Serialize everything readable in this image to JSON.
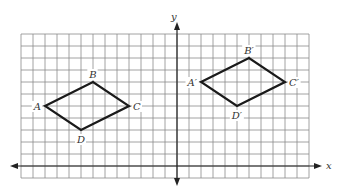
{
  "diagram": {
    "type": "coordinate-grid-translation",
    "grid": {
      "x_min": -13,
      "x_max": 11,
      "y_min": -1,
      "y_max": 11
    },
    "axes": {
      "x_label": "x",
      "y_label": "y"
    },
    "figures": [
      {
        "name": "ABCD",
        "vertices": [
          {
            "label": "A",
            "x": -11,
            "y": 5,
            "anchor": "left"
          },
          {
            "label": "B",
            "x": -7,
            "y": 7,
            "anchor": "top"
          },
          {
            "label": "C",
            "x": -4,
            "y": 5,
            "anchor": "right"
          },
          {
            "label": "D",
            "x": -8,
            "y": 3,
            "anchor": "bottom"
          }
        ]
      },
      {
        "name": "A'B'C'D'",
        "vertices": [
          {
            "label": "A′",
            "x": 2,
            "y": 7,
            "anchor": "left"
          },
          {
            "label": "B′",
            "x": 6,
            "y": 9,
            "anchor": "top"
          },
          {
            "label": "C′",
            "x": 9,
            "y": 7,
            "anchor": "right"
          },
          {
            "label": "D′",
            "x": 5,
            "y": 5,
            "anchor": "bottom"
          }
        ]
      }
    ]
  }
}
